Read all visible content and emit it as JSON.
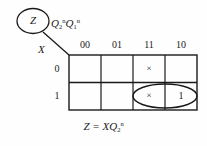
{
  "diagram": {
    "type": "karnaugh-map",
    "output_bubble": {
      "label": "Z"
    },
    "column_variable": {
      "base": "Q",
      "term1_sub": "2",
      "term1_sup": "n",
      "term2_base": "Q",
      "term2_sub": "1",
      "term2_sup": "n"
    },
    "row_variable": {
      "label": "X"
    },
    "column_headers": [
      "00",
      "01",
      "11",
      "10"
    ],
    "row_headers": [
      "0",
      "1"
    ],
    "cells": [
      [
        "",
        "",
        "×",
        ""
      ],
      [
        "",
        "",
        "×",
        "1"
      ]
    ],
    "grouping": {
      "shape": "ellipse",
      "covers": [
        "row1-col11",
        "row1-col10"
      ]
    },
    "equation": {
      "lhs": "Z",
      "op": "=",
      "rhs_var": "X",
      "rhs_base": "Q",
      "rhs_sub": "2",
      "rhs_sup": "n"
    },
    "colors": {
      "line": "#1a1a1a",
      "text": "#1a1a1a",
      "background": "#fefefe"
    }
  }
}
